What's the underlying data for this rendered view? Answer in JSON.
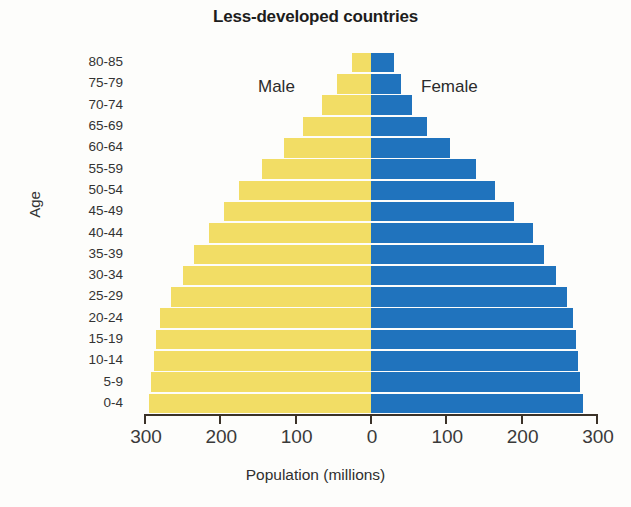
{
  "chart_data": {
    "type": "bar",
    "subtype": "population-pyramid",
    "title": "Less-developed countries",
    "xlabel": "Population (millions)",
    "ylabel": "Age",
    "grid": false,
    "legend_position": "in-plot",
    "axis_px_per_unit": 0.7533,
    "xlim": [
      -300,
      300
    ],
    "xticks": [
      300,
      200,
      100,
      0,
      100,
      200,
      300
    ],
    "xtick_labels": [
      "300",
      "200",
      "100",
      "0",
      "100",
      "200",
      "300"
    ],
    "categories": [
      "80-85",
      "75-79",
      "70-74",
      "65-69",
      "60-64",
      "55-59",
      "50-54",
      "45-49",
      "40-44",
      "35-39",
      "30-34",
      "25-29",
      "20-24",
      "15-19",
      "10-14",
      "5-9",
      "0-4"
    ],
    "series": [
      {
        "name": "Male",
        "color": "#f2dd65",
        "side": "left",
        "values": [
          25,
          45,
          65,
          90,
          115,
          145,
          175,
          195,
          215,
          235,
          250,
          265,
          280,
          285,
          288,
          292,
          295
        ]
      },
      {
        "name": "Female",
        "color": "#2073bd",
        "side": "right",
        "values": [
          30,
          40,
          55,
          75,
          105,
          140,
          165,
          190,
          215,
          230,
          245,
          260,
          268,
          272,
          275,
          278,
          281
        ]
      }
    ]
  },
  "labels": {
    "male": "Male",
    "female": "Female"
  },
  "colors": {
    "male_bar": "#f2dd65",
    "female_bar": "#2073bd",
    "axis": "#3b3228",
    "text": "#2b2b2b",
    "background": "#fdfdfb"
  }
}
